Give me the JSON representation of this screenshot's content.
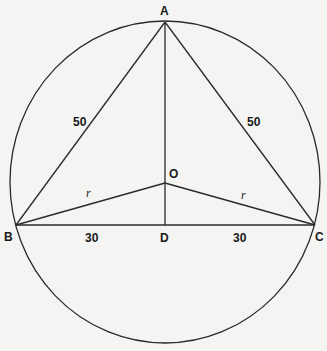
{
  "diagram": {
    "type": "geometry",
    "points": {
      "A": {
        "label": "A",
        "x": 165,
        "y": 22
      },
      "B": {
        "label": "B",
        "x": 16,
        "y": 225
      },
      "C": {
        "label": "C",
        "x": 315,
        "y": 225
      },
      "D": {
        "label": "D",
        "x": 165,
        "y": 225
      },
      "O": {
        "label": "O",
        "x": 165,
        "y": 183
      }
    },
    "circle": {
      "cx": 165,
      "cy": 182,
      "rx": 155,
      "ry": 161
    },
    "segments": [
      {
        "from": "A",
        "to": "B",
        "label": "50"
      },
      {
        "from": "A",
        "to": "C",
        "label": "50"
      },
      {
        "from": "B",
        "to": "D",
        "label": "30"
      },
      {
        "from": "D",
        "to": "C",
        "label": "30"
      },
      {
        "from": "O",
        "to": "B",
        "label": "r"
      },
      {
        "from": "O",
        "to": "C",
        "label": "r"
      },
      {
        "from": "A",
        "to": "D",
        "label": ""
      }
    ],
    "labels": {
      "A": "A",
      "B": "B",
      "C": "C",
      "D": "D",
      "O": "O",
      "AB": "50",
      "AC": "50",
      "BD": "30",
      "DC": "30",
      "OB": "r",
      "OC": "r"
    }
  }
}
